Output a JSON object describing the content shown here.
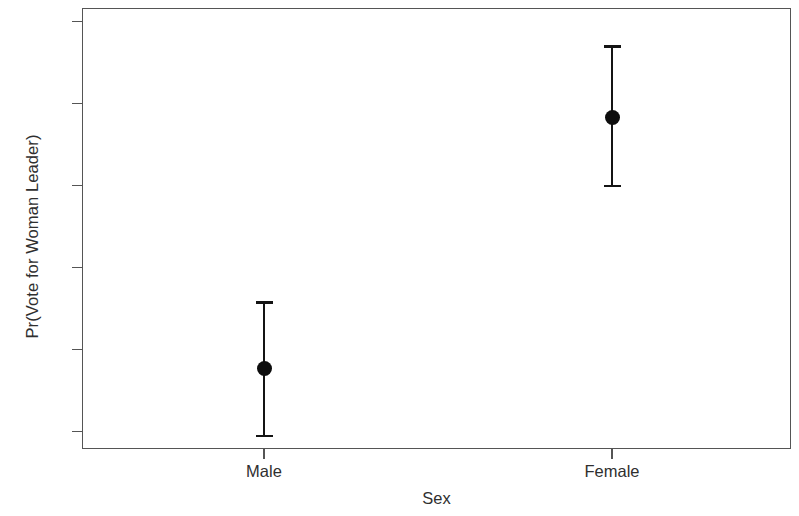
{
  "chart_data": {
    "type": "scatter",
    "title": "",
    "subtitle": "",
    "xlabel": "Sex",
    "ylabel": "Pr(Vote for Woman Leader)",
    "categories": [
      "Male",
      "Female"
    ],
    "values": [
      0.278,
      0.583
    ],
    "error_low": [
      0.195,
      0.5
    ],
    "error_high": [
      0.358,
      0.67
    ],
    "series": [
      {
        "name": "Predicted probability",
        "points": [
          {
            "x": "Male",
            "y": 0.278,
            "lower": 0.195,
            "upper": 0.358
          },
          {
            "x": "Female",
            "y": 0.583,
            "lower": 0.5,
            "upper": 0.67
          }
        ]
      }
    ],
    "ylim": [
      0.168,
      0.722
    ],
    "yticks": [
      0.2,
      0.3,
      0.4,
      0.5,
      0.6,
      0.7
    ],
    "ytick_labels": [
      "0.2",
      "0.3",
      "0.4",
      "0.5",
      "0.6",
      "0.7"
    ],
    "xticks": [
      "Male",
      "Female"
    ],
    "grid": false,
    "legend": false,
    "legend_position": "none",
    "marker": "filled-circle",
    "errorbar_style": "capped-vertical",
    "colors": {
      "marker": "#0d0d0d",
      "errorbar": "#141414",
      "frame": "#555555",
      "text": "#2f2f2f",
      "background": "#ffffff"
    }
  },
  "axes": {
    "y_label": "Pr(Vote for Woman Leader)",
    "x_label": "Sex",
    "y_ticks": [
      {
        "label": "0.7",
        "value": 0.7
      },
      {
        "label": "0.6",
        "value": 0.6
      },
      {
        "label": "0.5",
        "value": 0.5
      },
      {
        "label": "0.4",
        "value": 0.4
      },
      {
        "label": "0.3",
        "value": 0.3
      },
      {
        "label": "0.2",
        "value": 0.2
      }
    ],
    "x_ticks": [
      {
        "label": "Male"
      },
      {
        "label": "Female"
      }
    ]
  }
}
